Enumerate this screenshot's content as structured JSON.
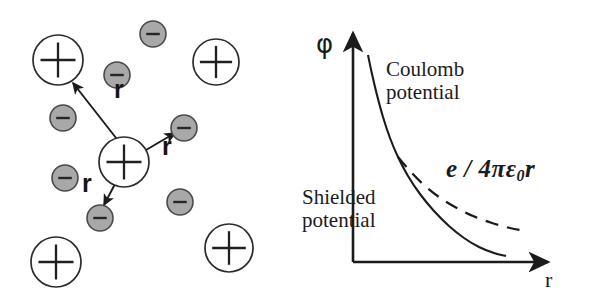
{
  "figure": {
    "width": 596,
    "height": 308,
    "background": "#ffffff",
    "ink_color": "#1b1b1b"
  },
  "ion_panel": {
    "name": "ion-cloud-diagram",
    "distance_labels": [
      {
        "text": "r",
        "x": 114,
        "y": 88
      },
      {
        "text": "r",
        "x": 162,
        "y": 145
      },
      {
        "text": "r",
        "x": 82,
        "y": 182
      }
    ],
    "positive_ions": [
      {
        "label": "+",
        "cx": 58,
        "cy": 60,
        "r": 25,
        "role": "lattice-ion"
      },
      {
        "label": "+",
        "cx": 216,
        "cy": 62,
        "r": 23,
        "role": "lattice-ion"
      },
      {
        "label": "+",
        "cx": 124,
        "cy": 162,
        "r": 25,
        "role": "central-ion"
      },
      {
        "label": "+",
        "cx": 56,
        "cy": 262,
        "r": 25,
        "role": "lattice-ion"
      },
      {
        "label": "+",
        "cx": 229,
        "cy": 248,
        "r": 24,
        "role": "lattice-ion"
      }
    ],
    "negative_ions": [
      {
        "label": "–",
        "cx": 153,
        "cy": 34,
        "r": 13
      },
      {
        "label": "–",
        "cx": 117,
        "cy": 75,
        "r": 13
      },
      {
        "label": "–",
        "cx": 63,
        "cy": 118,
        "r": 13
      },
      {
        "label": "–",
        "cx": 184,
        "cy": 128,
        "r": 13
      },
      {
        "label": "–",
        "cx": 65,
        "cy": 178,
        "r": 13
      },
      {
        "label": "–",
        "cx": 100,
        "cy": 218,
        "r": 13
      },
      {
        "label": "–",
        "cx": 180,
        "cy": 202,
        "r": 13
      }
    ],
    "arrows": [
      {
        "name": "arrow-to-upper-left-ion",
        "x1": 120,
        "y1": 143,
        "x2": 73,
        "y2": 83
      },
      {
        "name": "arrow-to-right-electron",
        "x1": 146,
        "y1": 150,
        "x2": 175,
        "y2": 133
      },
      {
        "name": "arrow-to-lower-electron",
        "x1": 115,
        "y1": 184,
        "x2": 104,
        "y2": 205
      }
    ],
    "colors": {
      "positive_fill": "#ffffff",
      "positive_stroke": "#2b2b2b",
      "negative_fill": "#a8a8a8",
      "negative_stroke": "#4a4a4a"
    }
  },
  "graph_panel": {
    "name": "potential-vs-distance-plot",
    "y_axis_label": "φ",
    "x_axis_label": "r",
    "annotations": {
      "coulomb": "Coulomb\npotential",
      "shielded": "Shielded\npotential",
      "formula_prefix": "e / 4πε",
      "formula_subscript": "0",
      "formula_suffix": "r"
    },
    "chart_data": {
      "type": "line",
      "title": "",
      "xlabel": "r",
      "ylabel": "φ",
      "grid": false,
      "legend": "inline-annotations",
      "axis_origin": {
        "x": 55,
        "y": 262
      },
      "axis_x_end": 250,
      "axis_y_top": 33,
      "series": [
        {
          "name": "Shielded potential",
          "style": "solid",
          "description": "Debye-screened potential, decays faster than 1/r",
          "points": [
            [
              70,
              55
            ],
            [
              74,
              74
            ],
            [
              79,
              95
            ],
            [
              85,
              117
            ],
            [
              92,
              138
            ],
            [
              100,
              157
            ],
            [
              110,
              176
            ],
            [
              122,
              194
            ],
            [
              136,
              211
            ],
            [
              151,
              226
            ],
            [
              166,
              238
            ],
            [
              181,
              247
            ],
            [
              196,
              253
            ],
            [
              208,
              256
            ]
          ]
        },
        {
          "name": "e / 4πε₀r",
          "style": "dashed",
          "description": "Unscreened Coulomb potential 1/r tail",
          "points": [
            [
              100,
              157
            ],
            [
              112,
              171
            ],
            [
              126,
              185
            ],
            [
              141,
              197
            ],
            [
              157,
              207
            ],
            [
              175,
              216
            ],
            [
              194,
              223
            ],
            [
              212,
              228
            ],
            [
              228,
              231
            ]
          ]
        }
      ]
    }
  }
}
